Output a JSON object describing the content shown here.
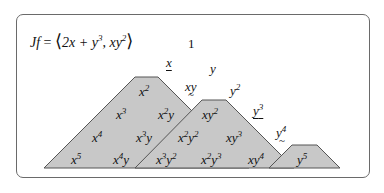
{
  "equation": {
    "lhs": "Jf",
    "eq": " = ",
    "open": "⟨",
    "gen1": "2x + y",
    "gen1_exp": "3",
    "sep": ", ",
    "gen2": "xy",
    "gen2_exp": "2",
    "close": "⟩"
  },
  "colors": {
    "region_fill": "#c8c8c8",
    "region_stroke": "#555555",
    "frame": "#6a6a6a"
  },
  "monomials": {
    "one": "1",
    "x": "x",
    "y": "y",
    "xy": "xy",
    "y2": {
      "base": "y",
      "exp": "2"
    },
    "y3": {
      "base": "y",
      "exp": "3"
    },
    "y4": {
      "base": "y",
      "exp": "4"
    },
    "x2": {
      "base": "x",
      "exp": "2"
    },
    "x3": {
      "base": "x",
      "exp": "3"
    },
    "x2y": {
      "base": "x",
      "exp": "2",
      "tail": "y"
    },
    "xy2": {
      "base": "xy",
      "exp": "2"
    },
    "x4": {
      "base": "x",
      "exp": "4"
    },
    "x3y": {
      "base": "x",
      "exp": "3",
      "tail": "y"
    },
    "x2y2": {
      "base": "x",
      "exp": "2",
      "tail": "y",
      "tail_exp": "2"
    },
    "xy3": {
      "base": "xy",
      "exp": "3"
    },
    "x5": {
      "base": "x",
      "exp": "5"
    },
    "x4y": {
      "base": "x",
      "exp": "4",
      "tail": "y"
    },
    "x3y2": {
      "base": "x",
      "exp": "3",
      "tail": "y",
      "tail_exp": "2"
    },
    "x2y3": {
      "base": "x",
      "exp": "2",
      "tail": "y",
      "tail_exp": "3"
    },
    "xy4": {
      "base": "xy",
      "exp": "4"
    },
    "y5": {
      "base": "y",
      "exp": "5"
    }
  }
}
